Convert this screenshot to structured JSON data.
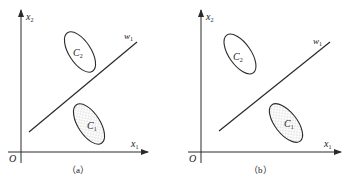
{
  "figure": {
    "panels": [
      {
        "id": "a",
        "caption": "（a）",
        "origin_label": "O",
        "x_axis": {
          "label": "x",
          "sub": "1"
        },
        "y_axis": {
          "label": "x",
          "sub": "2"
        },
        "boundary": {
          "label": "w",
          "sub": "1"
        },
        "classes": [
          {
            "label": "C",
            "sub": "2",
            "fill": "none",
            "position": "upper-left"
          },
          {
            "label": "C",
            "sub": "1",
            "fill": "dotted",
            "position": "lower-right"
          }
        ]
      },
      {
        "id": "b",
        "caption": "（b）",
        "origin_label": "O",
        "x_axis": {
          "label": "x",
          "sub": "1"
        },
        "y_axis": {
          "label": "x",
          "sub": "2"
        },
        "boundary": {
          "label": "w",
          "sub": "1"
        },
        "classes": [
          {
            "label": "C",
            "sub": "2",
            "fill": "none",
            "position": "upper-left"
          },
          {
            "label": "C",
            "sub": "1",
            "fill": "dotted",
            "position": "lower-right"
          }
        ]
      }
    ],
    "colors": {
      "stroke": "#2a2a2a",
      "background": "#ffffff"
    }
  }
}
